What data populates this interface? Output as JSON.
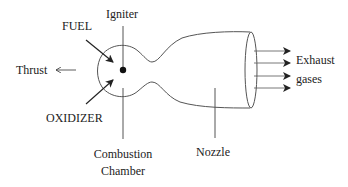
{
  "diagram": {
    "labels": {
      "fuel": "FUEL",
      "igniter": "Igniter",
      "thrust": "Thrust",
      "oxidizer": "OXIDIZER",
      "combustion_chamber_line1": "Combustion",
      "combustion_chamber_line2": "Chamber",
      "nozzle": "Nozzle",
      "exhaust_line1": "Exhaust",
      "exhaust_line2": "gases"
    },
    "components": [
      "combustion-chamber",
      "igniter",
      "throat",
      "nozzle",
      "nozzle-exit"
    ],
    "flows": [
      {
        "from": "FUEL",
        "to": "combustion-chamber"
      },
      {
        "from": "OXIDIZER",
        "to": "combustion-chamber"
      },
      {
        "from": "nozzle-exit",
        "to": "Exhaust gases",
        "arrow_count": 4
      },
      {
        "from": "engine",
        "to": "Thrust",
        "direction": "left"
      }
    ],
    "colors": {
      "stroke": "#555555",
      "text": "#222222",
      "background": "#ffffff"
    }
  }
}
